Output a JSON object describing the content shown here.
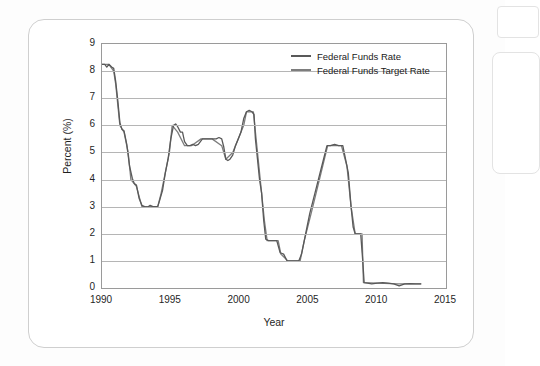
{
  "chart_data": {
    "type": "line",
    "title": "",
    "xlabel": "Year",
    "ylabel": "Percent (%)",
    "xlim": [
      1990,
      2015
    ],
    "ylim": [
      0,
      9
    ],
    "xticks": [
      "1990",
      "1995",
      "2000",
      "2005",
      "2010",
      "2015"
    ],
    "yticks": [
      "0",
      "1",
      "2",
      "3",
      "4",
      "5",
      "6",
      "7",
      "8",
      "9"
    ],
    "grid": true,
    "legend_position": "top-right",
    "series": [
      {
        "name": "Federal Funds Rate",
        "color": "#595959",
        "points": [
          [
            1990.0,
            8.25
          ],
          [
            1990.2,
            8.25
          ],
          [
            1990.35,
            8.15
          ],
          [
            1990.5,
            8.25
          ],
          [
            1990.7,
            8.15
          ],
          [
            1990.85,
            8.1
          ],
          [
            1991.0,
            7.6
          ],
          [
            1991.15,
            6.9
          ],
          [
            1991.3,
            6.1
          ],
          [
            1991.45,
            5.85
          ],
          [
            1991.6,
            5.8
          ],
          [
            1991.8,
            5.3
          ],
          [
            1992.0,
            4.5
          ],
          [
            1992.2,
            4.05
          ],
          [
            1992.35,
            3.85
          ],
          [
            1992.5,
            3.8
          ],
          [
            1992.7,
            3.3
          ],
          [
            1992.9,
            3.05
          ],
          [
            1993.1,
            3.0
          ],
          [
            1993.3,
            2.98
          ],
          [
            1993.5,
            3.05
          ],
          [
            1993.7,
            3.0
          ],
          [
            1993.9,
            3.0
          ],
          [
            1994.05,
            3.0
          ],
          [
            1994.2,
            3.25
          ],
          [
            1994.4,
            3.6
          ],
          [
            1994.6,
            4.25
          ],
          [
            1994.8,
            4.75
          ],
          [
            1995.0,
            5.5
          ],
          [
            1995.2,
            6.0
          ],
          [
            1995.35,
            6.05
          ],
          [
            1995.5,
            5.95
          ],
          [
            1995.7,
            5.75
          ],
          [
            1995.85,
            5.75
          ],
          [
            1996.0,
            5.4
          ],
          [
            1996.2,
            5.25
          ],
          [
            1996.4,
            5.25
          ],
          [
            1996.6,
            5.3
          ],
          [
            1996.8,
            5.25
          ],
          [
            1997.0,
            5.3
          ],
          [
            1997.3,
            5.5
          ],
          [
            1997.6,
            5.5
          ],
          [
            1997.9,
            5.5
          ],
          [
            1998.1,
            5.5
          ],
          [
            1998.3,
            5.5
          ],
          [
            1998.5,
            5.55
          ],
          [
            1998.7,
            5.5
          ],
          [
            1998.85,
            5.2
          ],
          [
            1999.0,
            4.75
          ],
          [
            1999.15,
            4.7
          ],
          [
            1999.3,
            4.75
          ],
          [
            1999.5,
            4.9
          ],
          [
            1999.7,
            5.25
          ],
          [
            1999.9,
            5.5
          ],
          [
            2000.1,
            5.75
          ],
          [
            2000.3,
            6.25
          ],
          [
            2000.5,
            6.5
          ],
          [
            2000.7,
            6.55
          ],
          [
            2000.9,
            6.5
          ],
          [
            2001.05,
            6.4
          ],
          [
            2001.15,
            5.5
          ],
          [
            2001.3,
            4.75
          ],
          [
            2001.45,
            4.0
          ],
          [
            2001.6,
            3.5
          ],
          [
            2001.75,
            2.5
          ],
          [
            2001.9,
            1.8
          ],
          [
            2002.1,
            1.75
          ],
          [
            2002.4,
            1.75
          ],
          [
            2002.7,
            1.75
          ],
          [
            2002.95,
            1.3
          ],
          [
            2003.2,
            1.25
          ],
          [
            2003.45,
            1.0
          ],
          [
            2003.7,
            1.0
          ],
          [
            2004.0,
            1.0
          ],
          [
            2004.3,
            1.0
          ],
          [
            2004.5,
            1.25
          ],
          [
            2004.7,
            1.75
          ],
          [
            2004.9,
            2.25
          ],
          [
            2005.1,
            2.75
          ],
          [
            2005.35,
            3.25
          ],
          [
            2005.6,
            3.75
          ],
          [
            2005.85,
            4.25
          ],
          [
            2006.1,
            4.75
          ],
          [
            2006.35,
            5.25
          ],
          [
            2006.6,
            5.25
          ],
          [
            2006.9,
            5.3
          ],
          [
            2007.2,
            5.25
          ],
          [
            2007.5,
            5.25
          ],
          [
            2007.7,
            4.75
          ],
          [
            2007.9,
            4.25
          ],
          [
            2008.1,
            3.0
          ],
          [
            2008.25,
            2.25
          ],
          [
            2008.4,
            2.0
          ],
          [
            2008.6,
            2.0
          ],
          [
            2008.8,
            2.0
          ],
          [
            2008.95,
            1.0
          ],
          [
            2009.05,
            0.2
          ],
          [
            2009.3,
            0.18
          ],
          [
            2009.6,
            0.15
          ],
          [
            2010.0,
            0.18
          ],
          [
            2010.4,
            0.2
          ],
          [
            2010.8,
            0.18
          ],
          [
            2011.2,
            0.15
          ],
          [
            2011.6,
            0.08
          ],
          [
            2012.0,
            0.15
          ],
          [
            2012.4,
            0.16
          ],
          [
            2012.8,
            0.15
          ],
          [
            2013.2,
            0.15
          ]
        ]
      },
      {
        "name": "Federal Funds Target Rate",
        "color": "#7d7d7d",
        "points": [
          [
            1990.0,
            8.25
          ],
          [
            1990.5,
            8.25
          ],
          [
            1990.85,
            8.0
          ],
          [
            1991.0,
            7.5
          ],
          [
            1991.3,
            6.0
          ],
          [
            1991.6,
            5.75
          ],
          [
            1991.9,
            5.0
          ],
          [
            1992.1,
            4.0
          ],
          [
            1992.5,
            3.75
          ],
          [
            1992.9,
            3.0
          ],
          [
            1993.5,
            3.0
          ],
          [
            1994.05,
            3.0
          ],
          [
            1994.3,
            3.5
          ],
          [
            1994.6,
            4.25
          ],
          [
            1994.9,
            5.0
          ],
          [
            1995.1,
            6.0
          ],
          [
            1995.5,
            5.75
          ],
          [
            1996.0,
            5.25
          ],
          [
            1996.5,
            5.25
          ],
          [
            1997.2,
            5.5
          ],
          [
            1998.0,
            5.5
          ],
          [
            1998.7,
            5.25
          ],
          [
            1999.0,
            4.75
          ],
          [
            1999.5,
            5.0
          ],
          [
            1999.9,
            5.5
          ],
          [
            2000.3,
            6.0
          ],
          [
            2000.5,
            6.5
          ],
          [
            2001.0,
            6.5
          ],
          [
            2001.2,
            5.5
          ],
          [
            2001.5,
            4.0
          ],
          [
            2001.8,
            2.5
          ],
          [
            2002.0,
            1.75
          ],
          [
            2002.8,
            1.75
          ],
          [
            2003.0,
            1.25
          ],
          [
            2003.5,
            1.0
          ],
          [
            2004.4,
            1.0
          ],
          [
            2004.7,
            1.75
          ],
          [
            2005.2,
            2.75
          ],
          [
            2005.8,
            4.0
          ],
          [
            2006.4,
            5.25
          ],
          [
            2007.4,
            5.25
          ],
          [
            2007.8,
            4.5
          ],
          [
            2008.1,
            3.0
          ],
          [
            2008.4,
            2.0
          ],
          [
            2008.9,
            2.0
          ],
          [
            2009.0,
            0.2
          ],
          [
            2010.0,
            0.18
          ],
          [
            2011.5,
            0.15
          ],
          [
            2013.2,
            0.15
          ]
        ]
      }
    ]
  },
  "legend": {
    "entries": [
      {
        "label": "Federal Funds Rate"
      },
      {
        "label": "Federal Funds Target Rate"
      }
    ]
  }
}
